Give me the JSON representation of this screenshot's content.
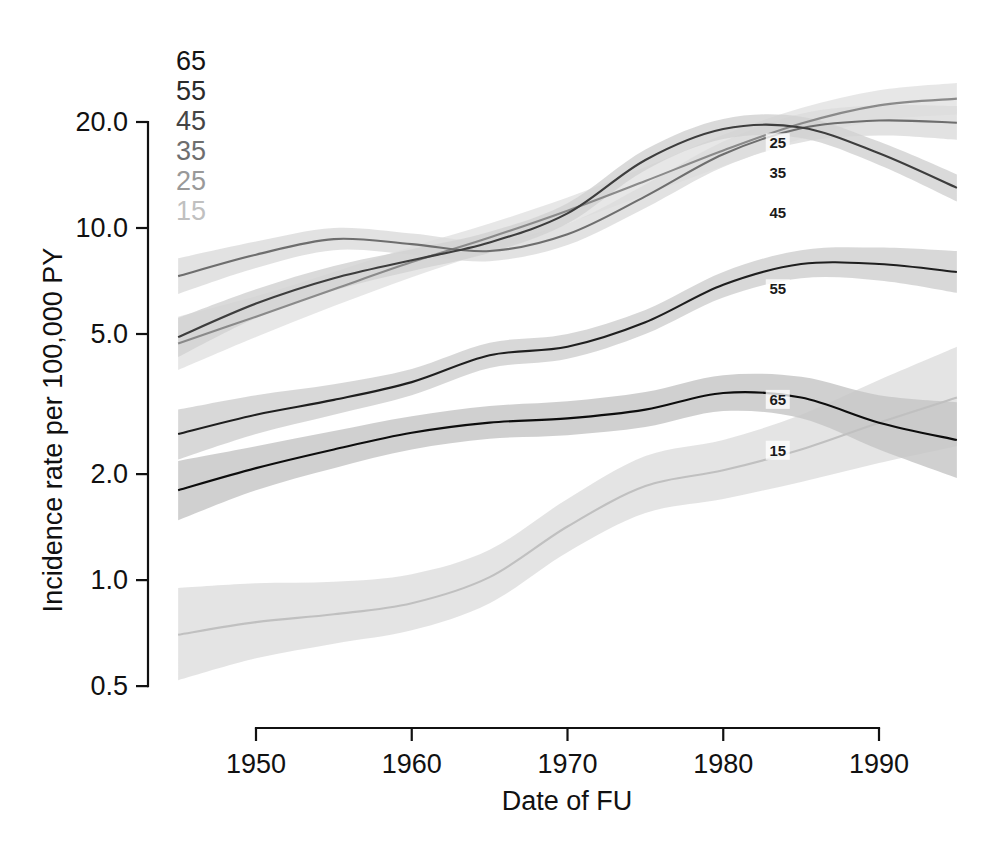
{
  "figure": {
    "type": "line-chart",
    "background": "#ffffff"
  },
  "axes": {
    "y": {
      "title": "Incidence rate per 100,000 PY",
      "scale": "log",
      "ticks": [
        "20.0",
        "10.0",
        "5.0",
        "2.0",
        "1.0",
        "0.5"
      ],
      "tick_values": [
        20.0,
        10.0,
        5.0,
        2.0,
        1.0,
        0.5
      ],
      "range": [
        0.5,
        24.0
      ]
    },
    "x": {
      "title": "Date of FU",
      "scale": "linear",
      "ticks": [
        "1950",
        "1960",
        "1970",
        "1980",
        "1990"
      ],
      "tick_values": [
        1950,
        1960,
        1970,
        1980,
        1990
      ],
      "range": [
        1945,
        1995
      ]
    }
  },
  "legend": {
    "position": "top-left-inside",
    "items": [
      {
        "label": "65",
        "color": "#141414"
      },
      {
        "label": "55",
        "color": "#2b2b2b"
      },
      {
        "label": "45",
        "color": "#454545"
      },
      {
        "label": "35",
        "color": "#6e6e6e"
      },
      {
        "label": "25",
        "color": "#999999"
      },
      {
        "label": "15",
        "color": "#c0c0c0"
      }
    ]
  },
  "inline_labels": [
    {
      "label": "25",
      "x": 1983.5,
      "y": 17.4,
      "color": "#1a1a1a"
    },
    {
      "label": "35",
      "x": 1983.5,
      "y": 14.3,
      "color": "#1a1a1a"
    },
    {
      "label": "45",
      "x": 1983.5,
      "y": 11.0,
      "color": "#1a1a1a"
    },
    {
      "label": "55",
      "x": 1983.5,
      "y": 6.7,
      "color": "#1a1a1a"
    },
    {
      "label": "65",
      "x": 1983.5,
      "y": 3.25,
      "color": "#1a1a1a"
    },
    {
      "label": "15",
      "x": 1983.5,
      "y": 2.33,
      "color": "#1a1a1a"
    }
  ],
  "chart_data": {
    "type": "line",
    "title": "",
    "xlabel": "Date of FU",
    "ylabel": "Incidence rate per 100,000 PY",
    "yscale": "log",
    "ylim": [
      0.5,
      24.0
    ],
    "xlim": [
      1945,
      1995
    ],
    "grid": false,
    "legend_position": "top-left-inside",
    "x": [
      1945,
      1950,
      1955,
      1960,
      1965,
      1970,
      1975,
      1980,
      1985,
      1990,
      1995
    ],
    "series": [
      {
        "name": "15",
        "color": "#c0c0c0",
        "band_color": "#dedede",
        "values": [
          0.7,
          0.76,
          0.8,
          0.86,
          1.02,
          1.42,
          1.85,
          2.05,
          2.35,
          2.8,
          3.3
        ],
        "lower": [
          0.52,
          0.6,
          0.66,
          0.72,
          0.86,
          1.2,
          1.55,
          1.7,
          1.9,
          2.15,
          2.4
        ],
        "upper": [
          0.95,
          0.98,
          0.99,
          1.04,
          1.22,
          1.7,
          2.25,
          2.5,
          2.95,
          3.7,
          4.6
        ]
      },
      {
        "name": "25",
        "color": "#8a8a8a",
        "band_color": "#e2e2e2",
        "values": [
          4.7,
          5.6,
          6.7,
          8.0,
          9.4,
          11.2,
          13.6,
          16.6,
          19.8,
          22.3,
          23.3
        ],
        "lower": [
          3.95,
          4.9,
          6.0,
          7.25,
          8.6,
          10.3,
          12.4,
          15.0,
          17.9,
          20.2,
          21.0
        ],
        "upper": [
          5.6,
          6.4,
          7.5,
          8.85,
          10.3,
          12.2,
          14.9,
          18.4,
          21.9,
          24.6,
          25.8
        ]
      },
      {
        "name": "35",
        "color": "#6e6e6e",
        "band_color": "#dcdcdc",
        "values": [
          7.3,
          8.4,
          9.3,
          9.0,
          8.6,
          9.6,
          12.3,
          16.2,
          19.2,
          20.2,
          19.9
        ],
        "lower": [
          6.5,
          7.7,
          8.65,
          8.4,
          8.05,
          8.95,
          11.4,
          14.9,
          17.5,
          18.3,
          17.8
        ],
        "upper": [
          8.2,
          9.15,
          10.0,
          9.65,
          9.2,
          10.3,
          13.3,
          17.6,
          21.1,
          22.3,
          22.2
        ]
      },
      {
        "name": "45",
        "color": "#3d3d3d",
        "band_color": "#d2d2d2",
        "values": [
          4.9,
          6.1,
          7.2,
          8.1,
          9.1,
          11.0,
          15.6,
          19.1,
          19.3,
          16.3,
          13.0
        ],
        "lower": [
          4.3,
          5.55,
          6.65,
          7.55,
          8.5,
          10.3,
          14.6,
          17.9,
          18.0,
          15.1,
          11.9
        ],
        "upper": [
          5.55,
          6.7,
          7.8,
          8.7,
          9.75,
          11.75,
          16.7,
          20.4,
          20.7,
          17.6,
          14.2
        ]
      },
      {
        "name": "55",
        "color": "#1f1f1f",
        "band_color": "#cfcfcf",
        "values": [
          2.6,
          2.95,
          3.25,
          3.65,
          4.35,
          4.6,
          5.4,
          6.9,
          7.9,
          7.9,
          7.5
        ],
        "lower": [
          2.2,
          2.6,
          2.95,
          3.35,
          4.0,
          4.25,
          5.0,
          6.35,
          7.2,
          7.1,
          6.55
        ],
        "upper": [
          3.05,
          3.35,
          3.6,
          3.98,
          4.72,
          5.0,
          5.85,
          7.5,
          8.65,
          8.8,
          8.6
        ]
      },
      {
        "name": "65",
        "color": "#0d0d0d",
        "band_color": "#c6c6c6",
        "values": [
          1.8,
          2.08,
          2.35,
          2.62,
          2.8,
          2.88,
          3.05,
          3.4,
          3.3,
          2.8,
          2.5
        ],
        "lower": [
          1.48,
          1.8,
          2.08,
          2.35,
          2.52,
          2.58,
          2.72,
          3.02,
          2.88,
          2.35,
          1.95
        ],
        "upper": [
          2.18,
          2.4,
          2.65,
          2.92,
          3.12,
          3.22,
          3.42,
          3.82,
          3.78,
          3.35,
          3.2
        ]
      }
    ]
  }
}
